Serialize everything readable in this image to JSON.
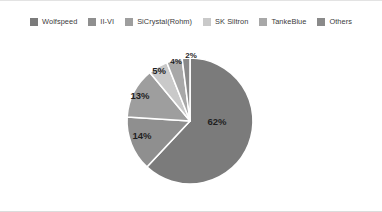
{
  "chart_data": {
    "type": "pie",
    "title": "",
    "categories": [
      "Wolfspeed",
      "II-VI",
      "SiCrystal(Rohm)",
      "SK Siltron",
      "TankeBlue",
      "Others"
    ],
    "values": [
      62,
      14,
      13,
      5,
      4,
      2
    ],
    "value_labels": [
      "62%",
      "14%",
      "13%",
      "5%",
      "4%",
      "2%"
    ],
    "unit": "%",
    "legend_position": "top",
    "grid": false,
    "start_angle_deg": -90,
    "direction": "clockwise",
    "colors": [
      "#7b7b7b",
      "#8f8f8f",
      "#9e9e9e",
      "#c9c9c9",
      "#a8a8a8",
      "#8a8a8a"
    ],
    "slice_separator_color": "#ffffff"
  },
  "legend": {
    "items": [
      {
        "label": "Wolfspeed",
        "color": "#7b7b7b"
      },
      {
        "label": "II-VI",
        "color": "#8f8f8f"
      },
      {
        "label": "SiCrystal(Rohm)",
        "color": "#9e9e9e"
      },
      {
        "label": "SK Siltron",
        "color": "#c9c9c9"
      },
      {
        "label": "TankeBlue",
        "color": "#a8a8a8"
      },
      {
        "label": "Others",
        "color": "#8a8a8a"
      }
    ]
  },
  "pie": {
    "center_x": 190,
    "center_y": 82,
    "radius": 63,
    "slices": [
      {
        "name": "Wolfspeed",
        "percent": 62,
        "label": "62%",
        "label_x": 217,
        "label_y": 86,
        "color": "#7b7b7b",
        "size": "large"
      },
      {
        "name": "II-VI",
        "percent": 14,
        "label": "14%",
        "label_x": 142,
        "label_y": 100,
        "color": "#8f8f8f",
        "size": "large"
      },
      {
        "name": "SiCrystal(Rohm)",
        "percent": 13,
        "label": "13%",
        "label_x": 140,
        "label_y": 60,
        "color": "#9e9e9e",
        "size": "large"
      },
      {
        "name": "SK Siltron",
        "percent": 5,
        "label": "5%",
        "label_x": 159,
        "label_y": 35,
        "color": "#c9c9c9",
        "size": "large"
      },
      {
        "name": "TankeBlue",
        "percent": 4,
        "label": "4%",
        "label_x": 176,
        "label_y": 25,
        "color": "#a8a8a8",
        "size": "small"
      },
      {
        "name": "Others",
        "percent": 2,
        "label": "2%",
        "label_x": 191,
        "label_y": 19,
        "color": "#8a8a8a",
        "size": "small"
      }
    ]
  }
}
